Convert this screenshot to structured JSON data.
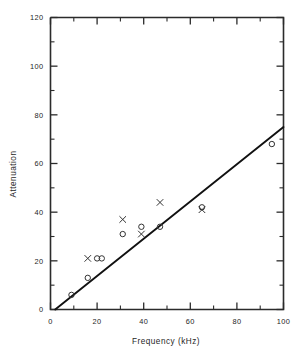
{
  "chart_data": {
    "type": "scatter",
    "title": "",
    "xlabel": "Frequency (kHz)",
    "ylabel": "Attenuation",
    "xlim": [
      0,
      100
    ],
    "ylim": [
      0,
      120
    ],
    "grid": false,
    "legend": "none",
    "x_ticks_major": [
      0,
      20,
      40,
      60,
      80,
      100
    ],
    "x_ticklabels": [
      "0",
      "20",
      "40",
      "60",
      "80",
      "100"
    ],
    "x_ticks_minor": [
      10,
      30,
      50,
      70,
      90
    ],
    "y_ticks_major": [
      0,
      20,
      40,
      60,
      80,
      100,
      120
    ],
    "y_ticklabels": [
      "0",
      "20",
      "40",
      "60",
      "80",
      "100",
      "120"
    ],
    "y_ticks_minor": [
      10,
      30,
      50,
      70,
      90,
      110
    ],
    "series": [
      {
        "name": "circle-markers",
        "marker": "circle",
        "points": [
          {
            "x": 9,
            "y": 6
          },
          {
            "x": 16,
            "y": 13
          },
          {
            "x": 20,
            "y": 21
          },
          {
            "x": 22,
            "y": 21
          },
          {
            "x": 31,
            "y": 31
          },
          {
            "x": 39,
            "y": 34
          },
          {
            "x": 47,
            "y": 34
          },
          {
            "x": 65,
            "y": 42
          },
          {
            "x": 95,
            "y": 68
          }
        ]
      },
      {
        "name": "cross-markers",
        "marker": "x",
        "points": [
          {
            "x": 16,
            "y": 21
          },
          {
            "x": 31,
            "y": 37
          },
          {
            "x": 39,
            "y": 31
          },
          {
            "x": 47,
            "y": 44
          },
          {
            "x": 65,
            "y": 41
          }
        ]
      }
    ],
    "fit_line": {
      "name": "trend-line",
      "x_start": 2,
      "y_start": 0,
      "x_end": 100,
      "y_end": 75,
      "slope": 0.765
    },
    "colors": {
      "axis": "#2b2b2b",
      "line": "#111111",
      "marker": "#333333",
      "background": "#ffffff"
    }
  }
}
